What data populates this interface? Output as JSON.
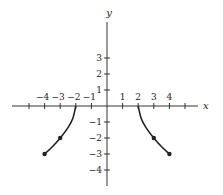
{
  "chart_data": {
    "type": "line",
    "title": "",
    "xlabel": "x",
    "ylabel": "y",
    "xlim": [
      -5.8,
      5.8
    ],
    "ylim": [
      -5.0,
      5.5
    ],
    "grid": false,
    "x_ticks": [
      -5,
      -4,
      -3,
      -2,
      -1,
      1,
      2,
      3,
      4,
      5
    ],
    "x_tick_labels": [
      "-4",
      "-3",
      "-2",
      "-1",
      "1",
      "2",
      "3",
      "4"
    ],
    "x_tick_label_values": [
      -4,
      -3,
      -2,
      -1,
      1,
      2,
      3,
      4
    ],
    "y_ticks": [
      3,
      2,
      1,
      -1,
      -2,
      -3,
      -4
    ],
    "y_tick_labels": [
      "3",
      "2",
      "1",
      "−1",
      "−2",
      "−3",
      "−4"
    ],
    "series": [
      {
        "name": "left branch",
        "points": [
          [
            -2,
            0
          ],
          [
            -2.2,
            -0.8
          ],
          [
            -2.5,
            -1.35
          ],
          [
            -3,
            -2
          ],
          [
            -3.5,
            -2.55
          ],
          [
            -4,
            -3
          ]
        ],
        "marked_points": [
          [
            -3,
            -2
          ],
          [
            -4,
            -3
          ]
        ],
        "open_end": [
          -2,
          0
        ]
      },
      {
        "name": "right branch",
        "points": [
          [
            2,
            0
          ],
          [
            2.2,
            -0.8
          ],
          [
            2.5,
            -1.35
          ],
          [
            3,
            -2
          ],
          [
            3.5,
            -2.55
          ],
          [
            4,
            -3
          ]
        ],
        "marked_points": [
          [
            3,
            -2
          ],
          [
            4,
            -3
          ]
        ],
        "open_end": [
          2,
          0
        ]
      }
    ],
    "colors": {
      "axis": "#333333",
      "curve": "#222222",
      "text": "#222222"
    }
  }
}
